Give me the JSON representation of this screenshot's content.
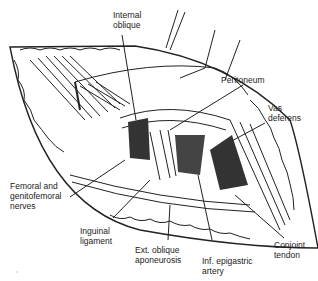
{
  "figure": {
    "type": "surgical anatomy line illustration"
  },
  "labels": {
    "internal_oblique": "Internal\noblique",
    "peritoneum": "Peritoneum",
    "vas_deferens": "Vas\ndeferens",
    "femoral_nerves": "Femoral and\ngenitofemoral\nnerves",
    "inguinal_ligament": "Inguinal\nligament",
    "ext_oblique": "Ext. oblique\naponeurosis",
    "inf_epigastric": "Inf. epigastric\nartery",
    "conjoint_tendon": "Conjoint\ntendon"
  },
  "colors": {
    "ink": "#222222",
    "dark_fill": "#333333",
    "background": "#ffffff"
  }
}
